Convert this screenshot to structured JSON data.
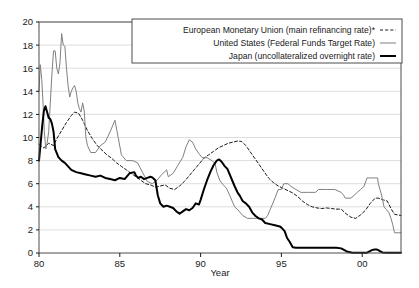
{
  "chart_data": {
    "type": "line",
    "title": "",
    "xlabel": "Year",
    "ylabel": "",
    "xlim": [
      1980,
      2002.4
    ],
    "ylim": [
      0,
      20
    ],
    "grid": "horizontal",
    "xticks": [
      1980,
      1985,
      1990,
      1995,
      2000
    ],
    "xtick_labels": [
      "80",
      "85",
      "90",
      "95",
      "00"
    ],
    "yticks": [
      0,
      2,
      4,
      6,
      8,
      10,
      12,
      14,
      16,
      18,
      20
    ],
    "ytick_labels": [
      "0",
      "2",
      "4",
      "6",
      "8",
      "10",
      "12",
      "14",
      "16",
      "18",
      "20"
    ],
    "legend_position": "top-right",
    "series": [
      {
        "name": "European Monetary Union (main refinancing rate)*",
        "style": "dashed",
        "color": "#1a1a1a",
        "width": 1.0,
        "points": [
          [
            1980.0,
            9.4
          ],
          [
            1980.3,
            9.1
          ],
          [
            1980.6,
            9.5
          ],
          [
            1980.9,
            9.3
          ],
          [
            1981.1,
            9.9
          ],
          [
            1981.4,
            10.6
          ],
          [
            1981.7,
            11.3
          ],
          [
            1982.0,
            11.9
          ],
          [
            1982.2,
            12.2
          ],
          [
            1982.45,
            12.1
          ],
          [
            1982.7,
            11.5
          ],
          [
            1983.0,
            10.6
          ],
          [
            1983.3,
            9.9
          ],
          [
            1983.6,
            9.3
          ],
          [
            1983.9,
            8.9
          ],
          [
            1984.2,
            8.5
          ],
          [
            1984.5,
            8.2
          ],
          [
            1984.8,
            7.8
          ],
          [
            1985.1,
            7.5
          ],
          [
            1985.4,
            7.2
          ],
          [
            1985.7,
            6.9
          ],
          [
            1986.0,
            6.6
          ],
          [
            1986.3,
            6.3
          ],
          [
            1986.6,
            6.0
          ],
          [
            1986.9,
            5.9
          ],
          [
            1987.2,
            5.7
          ],
          [
            1987.5,
            5.8
          ],
          [
            1987.8,
            5.9
          ],
          [
            1988.1,
            5.6
          ],
          [
            1988.4,
            5.5
          ],
          [
            1988.7,
            5.8
          ],
          [
            1989.0,
            6.2
          ],
          [
            1989.3,
            6.7
          ],
          [
            1989.6,
            7.2
          ],
          [
            1989.9,
            7.7
          ],
          [
            1990.2,
            8.2
          ],
          [
            1990.5,
            8.5
          ],
          [
            1990.8,
            8.8
          ],
          [
            1991.1,
            9.1
          ],
          [
            1991.4,
            9.3
          ],
          [
            1991.7,
            9.5
          ],
          [
            1992.0,
            9.6
          ],
          [
            1992.3,
            9.7
          ],
          [
            1992.55,
            9.65
          ],
          [
            1992.8,
            9.3
          ],
          [
            1993.0,
            8.9
          ],
          [
            1993.3,
            8.3
          ],
          [
            1993.6,
            7.7
          ],
          [
            1993.9,
            7.1
          ],
          [
            1994.2,
            6.5
          ],
          [
            1994.5,
            6.1
          ],
          [
            1994.8,
            5.8
          ],
          [
            1995.1,
            5.6
          ],
          [
            1995.4,
            5.4
          ],
          [
            1995.7,
            5.2
          ],
          [
            1996.0,
            4.9
          ],
          [
            1996.3,
            4.5
          ],
          [
            1996.6,
            4.2
          ],
          [
            1996.9,
            4.0
          ],
          [
            1997.2,
            3.9
          ],
          [
            1997.5,
            3.85
          ],
          [
            1997.8,
            3.9
          ],
          [
            1998.1,
            3.85
          ],
          [
            1998.4,
            3.8
          ],
          [
            1998.7,
            3.8
          ],
          [
            1999.0,
            3.4
          ],
          [
            1999.3,
            3.1
          ],
          [
            1999.6,
            3.0
          ],
          [
            1999.9,
            3.3
          ],
          [
            2000.2,
            3.7
          ],
          [
            2000.5,
            4.3
          ],
          [
            2000.8,
            4.75
          ],
          [
            2001.0,
            4.75
          ],
          [
            2001.3,
            4.6
          ],
          [
            2001.55,
            4.5
          ],
          [
            2001.8,
            3.8
          ],
          [
            2002.0,
            3.35
          ],
          [
            2002.2,
            3.3
          ],
          [
            2002.4,
            3.25
          ]
        ]
      },
      {
        "name": "United States (Federal Funds Target Rate)",
        "style": "thin-solid",
        "color": "#808080",
        "width": 1.0,
        "points": [
          [
            1980.0,
            14.0
          ],
          [
            1980.08,
            16.3
          ],
          [
            1980.17,
            15.0
          ],
          [
            1980.25,
            13.0
          ],
          [
            1980.33,
            10.5
          ],
          [
            1980.42,
            9.0
          ],
          [
            1980.5,
            9.5
          ],
          [
            1980.6,
            10.5
          ],
          [
            1980.7,
            13.0
          ],
          [
            1980.8,
            15.5
          ],
          [
            1980.9,
            17.5
          ],
          [
            1981.0,
            17.5
          ],
          [
            1981.1,
            16.0
          ],
          [
            1981.2,
            15.5
          ],
          [
            1981.3,
            16.5
          ],
          [
            1981.4,
            19.0
          ],
          [
            1981.5,
            18.0
          ],
          [
            1981.6,
            17.9
          ],
          [
            1981.7,
            16.0
          ],
          [
            1981.8,
            14.5
          ],
          [
            1981.9,
            13.5
          ],
          [
            1982.0,
            14.0
          ],
          [
            1982.1,
            14.3
          ],
          [
            1982.2,
            14.5
          ],
          [
            1982.3,
            14.0
          ],
          [
            1982.4,
            13.0
          ],
          [
            1982.5,
            12.5
          ],
          [
            1982.6,
            12.2
          ],
          [
            1982.7,
            13.0
          ],
          [
            1982.8,
            12.3
          ],
          [
            1982.9,
            10.0
          ],
          [
            1983.0,
            9.3
          ],
          [
            1983.2,
            8.7
          ],
          [
            1983.5,
            8.7
          ],
          [
            1983.8,
            9.3
          ],
          [
            1984.1,
            9.6
          ],
          [
            1984.4,
            10.5
          ],
          [
            1984.7,
            11.5
          ],
          [
            1984.9,
            10.0
          ],
          [
            1985.1,
            8.5
          ],
          [
            1985.4,
            8.0
          ],
          [
            1985.8,
            8.0
          ],
          [
            1986.1,
            7.8
          ],
          [
            1986.4,
            7.0
          ],
          [
            1986.7,
            6.2
          ],
          [
            1987.0,
            6.0
          ],
          [
            1987.3,
            6.3
          ],
          [
            1987.6,
            6.8
          ],
          [
            1987.9,
            7.2
          ],
          [
            1988.0,
            6.6
          ],
          [
            1988.3,
            6.9
          ],
          [
            1988.6,
            7.6
          ],
          [
            1988.9,
            8.3
          ],
          [
            1989.1,
            9.2
          ],
          [
            1989.3,
            9.8
          ],
          [
            1989.5,
            9.6
          ],
          [
            1989.7,
            9.0
          ],
          [
            1989.9,
            8.6
          ],
          [
            1990.1,
            8.25
          ],
          [
            1990.4,
            8.25
          ],
          [
            1990.7,
            8.0
          ],
          [
            1990.9,
            7.75
          ],
          [
            1991.0,
            7.0
          ],
          [
            1991.2,
            6.25
          ],
          [
            1991.4,
            5.9
          ],
          [
            1991.6,
            5.6
          ],
          [
            1991.8,
            5.0
          ],
          [
            1991.95,
            4.5
          ],
          [
            1992.1,
            4.0
          ],
          [
            1992.3,
            3.75
          ],
          [
            1992.6,
            3.25
          ],
          [
            1992.9,
            3.0
          ],
          [
            1993.2,
            3.0
          ],
          [
            1993.6,
            3.0
          ],
          [
            1994.0,
            3.0
          ],
          [
            1994.15,
            3.25
          ],
          [
            1994.3,
            3.75
          ],
          [
            1994.45,
            4.25
          ],
          [
            1994.6,
            4.75
          ],
          [
            1994.8,
            5.5
          ],
          [
            1995.0,
            5.5
          ],
          [
            1995.15,
            6.0
          ],
          [
            1995.4,
            6.0
          ],
          [
            1995.6,
            5.75
          ],
          [
            1995.9,
            5.5
          ],
          [
            1996.2,
            5.25
          ],
          [
            1996.6,
            5.25
          ],
          [
            1997.1,
            5.25
          ],
          [
            1997.3,
            5.5
          ],
          [
            1997.8,
            5.5
          ],
          [
            1998.3,
            5.5
          ],
          [
            1998.7,
            5.25
          ],
          [
            1998.85,
            5.0
          ],
          [
            1998.95,
            4.75
          ],
          [
            1999.3,
            4.75
          ],
          [
            1999.5,
            5.0
          ],
          [
            1999.7,
            5.25
          ],
          [
            1999.9,
            5.5
          ],
          [
            2000.1,
            5.75
          ],
          [
            2000.3,
            6.5
          ],
          [
            2000.6,
            6.5
          ],
          [
            2000.95,
            6.5
          ],
          [
            2001.0,
            6.0
          ],
          [
            2001.1,
            5.5
          ],
          [
            2001.2,
            5.0
          ],
          [
            2001.35,
            4.0
          ],
          [
            2001.5,
            3.75
          ],
          [
            2001.65,
            3.5
          ],
          [
            2001.78,
            3.0
          ],
          [
            2001.88,
            2.5
          ],
          [
            2002.0,
            1.75
          ],
          [
            2002.4,
            1.75
          ]
        ]
      },
      {
        "name": "Japan (uncollateralized overnight rate)",
        "style": "thick-solid",
        "color": "#000000",
        "width": 2.0,
        "points": [
          [
            1980.0,
            8.0
          ],
          [
            1980.1,
            9.5
          ],
          [
            1980.2,
            11.0
          ],
          [
            1980.3,
            12.3
          ],
          [
            1980.4,
            12.7
          ],
          [
            1980.5,
            12.2
          ],
          [
            1980.6,
            11.7
          ],
          [
            1980.7,
            11.6
          ],
          [
            1980.8,
            11.2
          ],
          [
            1980.9,
            10.5
          ],
          [
            1981.0,
            9.0
          ],
          [
            1981.2,
            8.3
          ],
          [
            1981.4,
            8.0
          ],
          [
            1981.6,
            7.8
          ],
          [
            1981.8,
            7.5
          ],
          [
            1982.0,
            7.2
          ],
          [
            1982.3,
            7.0
          ],
          [
            1982.6,
            6.9
          ],
          [
            1982.9,
            6.8
          ],
          [
            1983.2,
            6.7
          ],
          [
            1983.5,
            6.6
          ],
          [
            1983.8,
            6.7
          ],
          [
            1984.1,
            6.5
          ],
          [
            1984.4,
            6.4
          ],
          [
            1984.7,
            6.3
          ],
          [
            1985.0,
            6.5
          ],
          [
            1985.3,
            6.4
          ],
          [
            1985.6,
            6.9
          ],
          [
            1985.9,
            7.0
          ],
          [
            1986.0,
            6.7
          ],
          [
            1986.15,
            6.5
          ],
          [
            1986.3,
            6.6
          ],
          [
            1986.5,
            6.4
          ],
          [
            1986.7,
            6.5
          ],
          [
            1986.9,
            6.6
          ],
          [
            1987.0,
            6.55
          ],
          [
            1987.2,
            6.3
          ],
          [
            1987.35,
            5.0
          ],
          [
            1987.5,
            4.3
          ],
          [
            1987.7,
            4.0
          ],
          [
            1987.9,
            4.1
          ],
          [
            1988.1,
            4.0
          ],
          [
            1988.3,
            3.9
          ],
          [
            1988.5,
            3.6
          ],
          [
            1988.7,
            3.4
          ],
          [
            1988.9,
            3.6
          ],
          [
            1989.1,
            3.8
          ],
          [
            1989.3,
            3.7
          ],
          [
            1989.5,
            3.9
          ],
          [
            1989.7,
            4.3
          ],
          [
            1989.9,
            4.2
          ],
          [
            1990.0,
            4.6
          ],
          [
            1990.2,
            5.5
          ],
          [
            1990.4,
            6.3
          ],
          [
            1990.6,
            7.0
          ],
          [
            1990.8,
            7.6
          ],
          [
            1991.0,
            8.0
          ],
          [
            1991.15,
            8.1
          ],
          [
            1991.3,
            7.9
          ],
          [
            1991.5,
            7.5
          ],
          [
            1991.65,
            7.3
          ],
          [
            1991.8,
            6.8
          ],
          [
            1991.95,
            6.3
          ],
          [
            1992.1,
            5.8
          ],
          [
            1992.2,
            5.5
          ],
          [
            1992.3,
            5.2
          ],
          [
            1992.45,
            4.9
          ],
          [
            1992.6,
            4.5
          ],
          [
            1992.8,
            4.3
          ],
          [
            1993.0,
            4.0
          ],
          [
            1993.2,
            3.5
          ],
          [
            1993.4,
            3.2
          ],
          [
            1993.6,
            3.0
          ],
          [
            1993.8,
            2.9
          ],
          [
            1994.0,
            2.6
          ],
          [
            1994.3,
            2.5
          ],
          [
            1994.6,
            2.4
          ],
          [
            1994.9,
            2.3
          ],
          [
            1995.0,
            2.2
          ],
          [
            1995.2,
            1.9
          ],
          [
            1995.35,
            1.3
          ],
          [
            1995.5,
            1.0
          ],
          [
            1995.7,
            0.5
          ],
          [
            1995.9,
            0.45
          ],
          [
            1996.2,
            0.45
          ],
          [
            1996.6,
            0.45
          ],
          [
            1997.2,
            0.45
          ],
          [
            1997.9,
            0.45
          ],
          [
            1998.4,
            0.45
          ],
          [
            1998.7,
            0.4
          ],
          [
            1998.9,
            0.25
          ],
          [
            1999.1,
            0.1
          ],
          [
            1999.4,
            0.03
          ],
          [
            1999.9,
            0.03
          ],
          [
            2000.3,
            0.03
          ],
          [
            2000.6,
            0.25
          ],
          [
            2000.75,
            0.3
          ],
          [
            2000.9,
            0.3
          ],
          [
            2001.0,
            0.25
          ],
          [
            2001.1,
            0.15
          ],
          [
            2001.25,
            0.05
          ],
          [
            2001.5,
            0.02
          ],
          [
            2002.0,
            0.02
          ],
          [
            2002.4,
            0.02
          ]
        ]
      }
    ]
  },
  "legend": {
    "items": [
      {
        "label": "European Monetary Union (main refinancing rate)*",
        "sample": "dashed"
      },
      {
        "label": "United States (Federal Funds Target Rate)",
        "sample": "thin-solid"
      },
      {
        "label": "Japan (uncollateralized overnight rate)",
        "sample": "thick-solid"
      }
    ]
  },
  "axis": {
    "x_title": "Year"
  }
}
